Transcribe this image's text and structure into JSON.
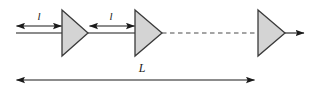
{
  "diagram": {
    "background_color": "#ffffff",
    "line_color": "#1a1a1a",
    "triangle_fill": "#d4d4d4",
    "triangle_stroke": "#3a3a3a",
    "segment_labels": [
      {
        "text": "l",
        "x": 39,
        "y": 20
      },
      {
        "text": "l",
        "x": 111,
        "y": 20
      }
    ],
    "total_label": {
      "text": "L",
      "x": 142,
      "y": 72
    },
    "triangles": [
      {
        "name": "amplifier-1",
        "left": 62,
        "right": 88,
        "top": 10,
        "bottom": 56
      },
      {
        "name": "amplifier-2",
        "left": 135,
        "right": 162,
        "top": 10,
        "bottom": 56
      },
      {
        "name": "amplifier-3",
        "left": 258,
        "right": 285,
        "top": 10,
        "bottom": 56
      }
    ],
    "baseline": {
      "y": 33,
      "start_x": 16,
      "end_x": 305
    },
    "dashed_segment": {
      "y": 33,
      "start_x": 162,
      "end_x": 258
    },
    "dimension_arrows": [
      {
        "name": "segment-1",
        "y": 26,
        "start_x": 16,
        "end_x": 62
      },
      {
        "name": "segment-2",
        "y": 26,
        "start_x": 89,
        "end_x": 135
      },
      {
        "name": "total-length",
        "y": 80,
        "start_x": 16,
        "end_x": 255
      }
    ]
  }
}
